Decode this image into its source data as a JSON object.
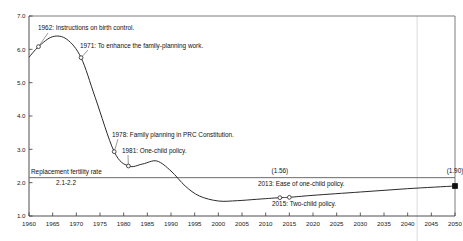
{
  "chart_data": {
    "type": "line",
    "title": "",
    "xlabel": "",
    "ylabel": "",
    "xlim": [
      1960,
      2050
    ],
    "ylim": [
      1.0,
      7.0
    ],
    "grid": false,
    "legend": "none",
    "x_ticks": [
      1960,
      1965,
      1970,
      1975,
      1980,
      1985,
      1990,
      1995,
      2000,
      2005,
      2010,
      2015,
      2020,
      2025,
      2030,
      2035,
      2040,
      2045,
      2050
    ],
    "y_ticks": [
      "1.0",
      "2.0",
      "3.0",
      "4.0",
      "5.0",
      "6.0",
      "7.0"
    ],
    "series": [
      {
        "name": "Total fertility rate",
        "x": [
          1960,
          1962,
          1965,
          1968,
          1971,
          1974,
          1978,
          1981,
          1984,
          1987,
          1990,
          1993,
          1996,
          2000,
          2004,
          2008,
          2013,
          2015,
          2020,
          2030,
          2040,
          2050
        ],
        "values": [
          5.76,
          6.08,
          6.38,
          6.3,
          5.75,
          4.55,
          2.93,
          2.5,
          2.56,
          2.65,
          2.35,
          1.9,
          1.6,
          1.45,
          1.46,
          1.5,
          1.55,
          1.56,
          1.62,
          1.72,
          1.82,
          1.9
        ]
      }
    ],
    "reference_line": {
      "label_line1": "Replacement fertility rate",
      "label_line2": "2.1-2.2",
      "value": 2.15
    },
    "value_labels": [
      {
        "text": "(1.56)",
        "x": 2013,
        "y": 2.15
      },
      {
        "text": "(1.90)",
        "x": 2050,
        "y": 2.15
      }
    ],
    "projection_divider": 2042,
    "annotations": [
      {
        "text": "1962: Instructions on birth control.",
        "point_x": 1962,
        "point_y": 6.08
      },
      {
        "text": "1971: To enhance the family-planning work.",
        "point_x": 1971,
        "point_y": 5.75
      },
      {
        "text": "1978: Family planning in PRC Constitution.",
        "point_x": 1978,
        "point_y": 2.93
      },
      {
        "text": "1981: One-child policy.",
        "point_x": 1981,
        "point_y": 2.5
      },
      {
        "text": "2013: Ease of one-child policy.",
        "point_x": 2013,
        "point_y": 1.55
      },
      {
        "text": "2015: Two-child policy.",
        "point_x": 2015,
        "point_y": 1.56
      }
    ],
    "markers": [
      {
        "x": 1962,
        "y": 6.08,
        "style": "open"
      },
      {
        "x": 1971,
        "y": 5.75,
        "style": "open"
      },
      {
        "x": 1978,
        "y": 2.93,
        "style": "open"
      },
      {
        "x": 1981,
        "y": 2.5,
        "style": "open"
      },
      {
        "x": 2013,
        "y": 1.55,
        "style": "open"
      },
      {
        "x": 2015,
        "y": 1.56,
        "style": "open"
      },
      {
        "x": 2050,
        "y": 1.9,
        "style": "solid"
      }
    ],
    "colors": {
      "line": "#2b2b2b",
      "reference": "#6b6b6b",
      "axis": "#3a3a3a",
      "divider": "#c9c9d6",
      "background": "#ffffff"
    }
  }
}
